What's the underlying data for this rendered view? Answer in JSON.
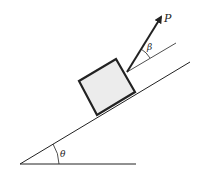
{
  "diagram": {
    "type": "inclined-plane-free-body",
    "labels": {
      "force": "P",
      "force_angle": "β",
      "incline_angle": "θ"
    },
    "colors": {
      "stroke": "#222222",
      "block_fill": "#ececec",
      "background": "#ffffff"
    }
  }
}
